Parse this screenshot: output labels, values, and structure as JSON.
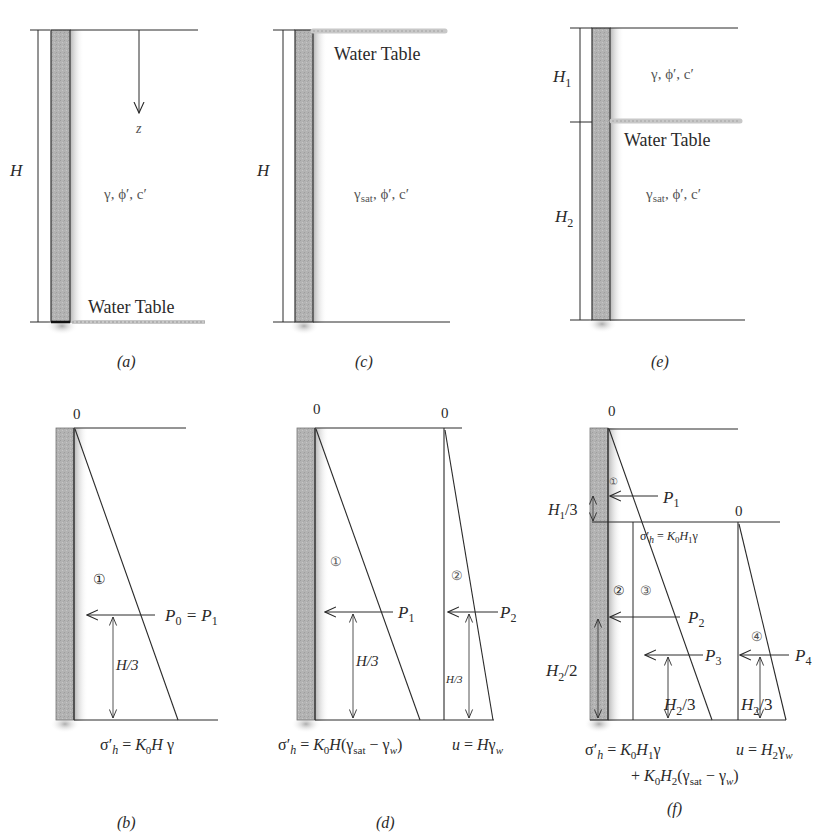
{
  "figure": {
    "panels": {
      "a": {
        "caption": "(a)",
        "height_label": "H",
        "depth_label": "z",
        "soil_props": "γ, ϕ′, c′",
        "water_table_label": "Water Table"
      },
      "c": {
        "caption": "(c)",
        "height_label": "H",
        "soil_props_gamma": "γ",
        "soil_props_sub": "sat",
        "soil_props_rest": ", ϕ′, c′",
        "water_table_label": "Water Table"
      },
      "e": {
        "caption": "(e)",
        "h1_label": "H",
        "h1_sub": "1",
        "h2_label": "H",
        "h2_sub": "2",
        "upper_soil_props": "γ, ϕ′, c′",
        "lower_soil_props_gamma": "γ",
        "lower_soil_props_sub": "sat",
        "lower_soil_props_rest": ", ϕ′, c′",
        "water_table_label": "Water Table"
      },
      "b": {
        "caption": "(b)",
        "zero_label": "0",
        "region_1": "①",
        "force_label": "P",
        "force_sub0": "0",
        "force_eq": " = P",
        "force_sub1": "1",
        "arm_label": "H/3",
        "formula": "σ′h = K0H γ"
      },
      "d": {
        "caption": "(d)",
        "zero_label_1": "0",
        "zero_label_2": "0",
        "region_1": "①",
        "region_2": "②",
        "force_1": "P",
        "force_1_sub": "1",
        "force_2": "P",
        "force_2_sub": "2",
        "arm_label_1": "H/3",
        "arm_label_2": "H/3",
        "formula_effective": "σ′h = K0H(γsat − γw)",
        "formula_pore": "u = Hγw"
      },
      "f": {
        "caption": "(f)",
        "zero_label_1": "0",
        "zero_label_2": "0",
        "region_1": "①",
        "region_2": "②",
        "region_3": "③",
        "region_4": "④",
        "force_1": "P1",
        "force_2": "P2",
        "force_3": "P3",
        "force_4": "P4",
        "arm_h1_3": "H1/3",
        "arm_h2_2": "H2/2",
        "arm_h2_3_a": "H2/3",
        "arm_h2_3_b": "H2/3",
        "stress_at_wt": "σ′h = K0H1γ",
        "formula_effective_line1": "σ′h = K0H1γ",
        "formula_effective_line2": "+ K0H2(γsat − γw)",
        "formula_pore": "u = H2γw"
      }
    },
    "colors": {
      "line": "#2a2a2a",
      "wall_fill": "#b8b8b8",
      "water_table": "#c8c8c8"
    }
  }
}
